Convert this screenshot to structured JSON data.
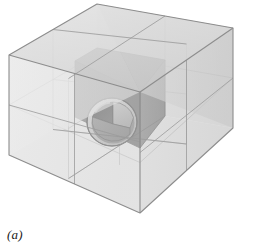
{
  "figure": {
    "caption": "(a)",
    "kind": "3d-geometry-illustration"
  },
  "colors": {
    "background": "#ffffff",
    "outer_top_face": "#dcdcdc",
    "outer_left_face": "#e9e9e9",
    "outer_right_face": "#d2d2d2",
    "outer_edge_line": "#9a9a9a",
    "inner_top_face": "#6e6e6e",
    "inner_left_face": "#5d5d5d",
    "inner_right_face": "#7a7a7a",
    "inner_edge_line": "#4a4a4a",
    "cavity_rim": "#b9b9b9",
    "cavity_face_top": "#9d9d9d",
    "cavity_face_left": "#3b3b3b",
    "cavity_face_right": "#6a6a6a",
    "cavity_outline": "#2e2e2e",
    "caption_text": "#1a1a1a"
  },
  "geometry": {
    "outer_cube": {
      "description": "large transparent cube subdivided 2 x 2 x 2 into eight sub-cubes",
      "subdivisions": 2,
      "vertices": {
        "top_back": [
          97,
          4
        ],
        "top_left": [
          9,
          55
        ],
        "top_right": [
          233,
          28
        ],
        "top_front": [
          140,
          92
        ],
        "bottom_left": [
          9,
          155
        ],
        "bottom_front": [
          140,
          213
        ],
        "bottom_right": [
          233,
          178
        ]
      }
    },
    "inner_cube": {
      "description": "single opaque dark sub-cube occupying the front-upper-right octant",
      "vertices": {
        "top_back": [
          97,
          48
        ],
        "top_left": [
          75,
          61
        ],
        "top_right": [
          165,
          60
        ],
        "top_front": [
          140,
          92
        ],
        "bottom_left": [
          75,
          117
        ],
        "bottom_front": [
          140,
          148
        ],
        "bottom_right": [
          165,
          116
        ]
      }
    },
    "cavity": {
      "description": "spherical void opening at the front vertex of the dark sub-cube, showing three internal quarter faces meeting at the cube corner",
      "center": [
        112,
        122
      ],
      "radius_x": 25,
      "radius_y": 24,
      "corner_point": [
        113,
        124
      ],
      "visible_internal_faces": 3
    }
  },
  "annotations": {
    "labels": []
  }
}
